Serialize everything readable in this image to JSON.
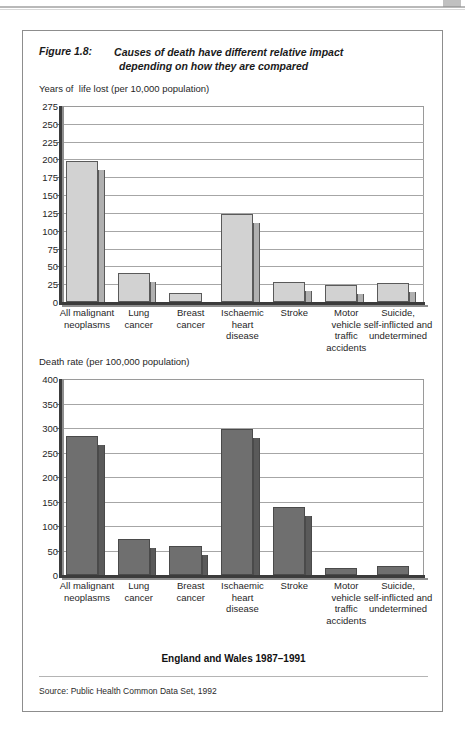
{
  "figure": {
    "number_label": "Figure 1.8:",
    "caption_line1": "Causes of death have different relative impact",
    "caption_line2": "depending on how they are compared",
    "footer_caption": "England and Wales 1987–1991",
    "source": "Source: Public Health Common Data Set, 1992"
  },
  "colors": {
    "top_bar_fill": "#d2d2d2",
    "top_bar_side": "#b0b0b0",
    "bottom_bar_fill": "#6f6f6f",
    "bottom_bar_side": "#5a5a5a",
    "gridline": "#a6a6a6",
    "axis": "#3b3b3b",
    "frame": "#8d8d8d"
  },
  "chart_data": [
    {
      "type": "bar",
      "title": "Years of  life lost (per 10,000 population)",
      "xlabel": "",
      "ylabel": "Years of  life lost (per 10,000 population)",
      "ylim": [
        0,
        275
      ],
      "ytick_step": 25,
      "yticks": [
        275,
        250,
        225,
        200,
        175,
        150,
        125,
        100,
        75,
        50,
        25,
        0
      ],
      "grid": true,
      "legend": "none",
      "categories": [
        "All malignant\nneoplasms",
        "Lung\ncancer",
        "Breast\ncancer",
        "Ischaemic\nheart\ndisease",
        "Stroke",
        "Motor\nvehicle\ntraffic\naccidents",
        "Suicide,\nself-inflicted and\nundetermined"
      ],
      "values": [
        198,
        41,
        12,
        124,
        28,
        24,
        27
      ]
    },
    {
      "type": "bar",
      "title": "Death rate (per 100,000 population)",
      "xlabel": "",
      "ylabel": "Death rate (per 100,000 population)",
      "ylim": [
        0,
        400
      ],
      "ytick_step": 50,
      "yticks": [
        400,
        350,
        300,
        250,
        200,
        150,
        100,
        50,
        0
      ],
      "grid": true,
      "legend": "none",
      "categories": [
        "All malignant\nneoplasms",
        "Lung\ncancer",
        "Breast\ncancer",
        "Ischaemic\nheart\ndisease",
        "Stroke",
        "Motor\nvehicle\ntraffic\naccidents",
        "Suicide,\nself-inflicted and\nundetermined"
      ],
      "values": [
        283,
        74,
        59,
        298,
        138,
        14,
        19
      ]
    }
  ]
}
